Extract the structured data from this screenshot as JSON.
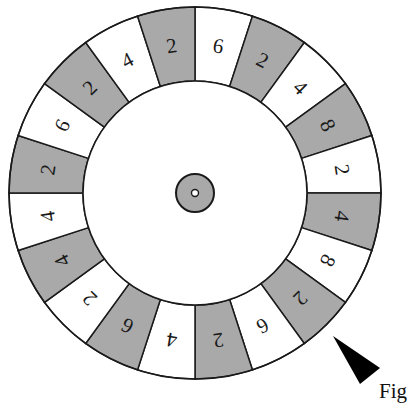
{
  "figure": {
    "caption": "Fig",
    "center": [
      195,
      193
    ],
    "outer_radius": 186,
    "inner_radius": 112,
    "hub_radius": 19,
    "hub_hole_radius": 3.5,
    "label_radius": 149,
    "colors": {
      "shaded": "#a9a9a9",
      "unshaded": "#ffffff",
      "stroke": "#1a1a1a",
      "pointer": "#000000"
    },
    "pointer": {
      "points": [
        [
          333,
          336
        ],
        [
          380,
          368
        ],
        [
          360,
          384
        ]
      ]
    }
  },
  "wheel": {
    "segment_count": 20,
    "start_angle_deg": 0,
    "direction": "clockwise-from-12-oclock",
    "segments": [
      {
        "value": "6",
        "shaded": false
      },
      {
        "value": "2",
        "shaded": true
      },
      {
        "value": "4",
        "shaded": false
      },
      {
        "value": "8",
        "shaded": true
      },
      {
        "value": "2",
        "shaded": false
      },
      {
        "value": "4",
        "shaded": true
      },
      {
        "value": "8",
        "shaded": false
      },
      {
        "value": "2",
        "shaded": true
      },
      {
        "value": "6",
        "shaded": false
      },
      {
        "value": "2",
        "shaded": true
      },
      {
        "value": "4",
        "shaded": false
      },
      {
        "value": "6",
        "shaded": true
      },
      {
        "value": "2",
        "shaded": false
      },
      {
        "value": "4",
        "shaded": true
      },
      {
        "value": "4",
        "shaded": false
      },
      {
        "value": "2",
        "shaded": true
      },
      {
        "value": "6",
        "shaded": false
      },
      {
        "value": "2",
        "shaded": true
      },
      {
        "value": "4",
        "shaded": false
      },
      {
        "value": "2",
        "shaded": true
      }
    ]
  }
}
